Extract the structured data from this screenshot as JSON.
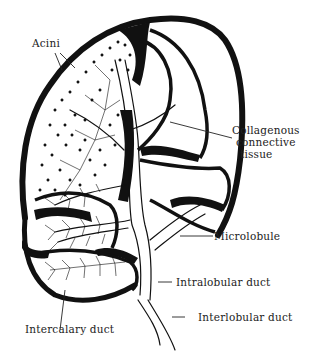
{
  "diagram": {
    "colors": {
      "ink": "#111111",
      "background": "#ffffff",
      "label_text": "#222222"
    },
    "labels": {
      "acini": "Acini",
      "collagenous_1": "Collagenous",
      "collagenous_2": "connective",
      "collagenous_3": "tissue",
      "microlobule": "Microlobule",
      "intralobular_duct": "Intralobular duct",
      "interlobular_duct": "Interlobular duct",
      "intercalary_duct": "Intercalary duct"
    }
  }
}
